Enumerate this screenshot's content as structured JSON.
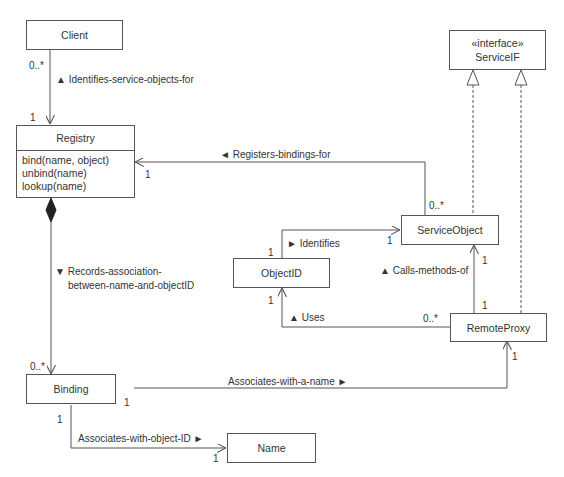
{
  "classes": {
    "client": {
      "name": "Client"
    },
    "registry": {
      "name": "Registry",
      "operations": [
        "bind(name, object)",
        "unbind(name)",
        "lookup(name)"
      ]
    },
    "service_if": {
      "stereotype": "«interface»",
      "name": "ServiceIF"
    },
    "service_object": {
      "name": "ServiceObject"
    },
    "object_id": {
      "name": "ObjectID"
    },
    "remote_proxy": {
      "name": "RemoteProxy"
    },
    "binding": {
      "name": "Binding"
    },
    "name": {
      "name": "Name"
    }
  },
  "associations": {
    "client_registry": {
      "label": "▲  Identifies-service-objects-for",
      "mult_client": "0..*",
      "mult_registry": "1"
    },
    "serviceobject_registry": {
      "label": "◄  Registers-bindings-for",
      "mult_registry": "1",
      "mult_service": "0..*"
    },
    "registry_binding": {
      "label_line1": "▼  Records-association-",
      "label_line2": "between-name-and-objectID",
      "mult_binding": "0..*"
    },
    "objectid_serviceobject": {
      "label": "►  Identifies",
      "mult_objectid": "1",
      "mult_service": "1"
    },
    "proxy_serviceobject": {
      "label": "▲  Calls-methods-of",
      "mult_service": "1",
      "mult_proxy": "1"
    },
    "proxy_objectid": {
      "label": "▲  Uses",
      "mult_objectid": "1",
      "mult_proxy": "0..*"
    },
    "binding_proxy": {
      "label": "Associates-with-a-name  ►",
      "mult_binding": "1",
      "mult_proxy": "1"
    },
    "binding_name": {
      "label": "Associates-with-object-ID  ►",
      "mult_binding": "1",
      "mult_name": "1"
    }
  }
}
